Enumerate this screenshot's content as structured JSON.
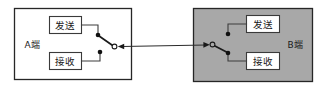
{
  "diagram": {
    "background_color": "#ffffff",
    "panels": [
      {
        "id": "panel-a",
        "label": "A端",
        "fill_color": "#ffffff",
        "border_color": "#262626",
        "boxes": [
          {
            "id": "a-send",
            "label": "发送"
          },
          {
            "id": "a-receive",
            "label": "接收"
          }
        ],
        "switch": {
          "id": "switch-a",
          "position": "send",
          "terminals": [
            "发送",
            "接收"
          ],
          "pole_style": "open-circle"
        }
      },
      {
        "id": "panel-b",
        "label": "B端",
        "fill_color": "#a8a8a8",
        "border_color": "#262626",
        "boxes": [
          {
            "id": "b-send",
            "label": "发送"
          },
          {
            "id": "b-receive",
            "label": "接收"
          }
        ],
        "switch": {
          "id": "switch-b",
          "position": "receive",
          "terminals": [
            "发送",
            "接收"
          ],
          "pole_style": "open-circle"
        }
      }
    ],
    "link": {
      "id": "transmission-link",
      "style": "bidirectional-arrows",
      "color": "#2b2b2b"
    }
  }
}
